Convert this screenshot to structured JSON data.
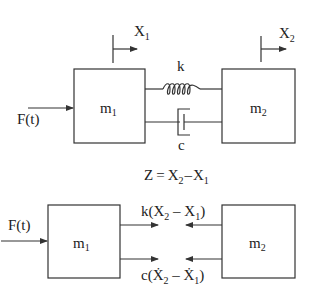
{
  "top_diagram": {
    "mass1": {
      "label": "m",
      "sub": "1"
    },
    "mass2": {
      "label": "m",
      "sub": "2"
    },
    "disp1": {
      "label": "X",
      "sub": "1"
    },
    "disp2": {
      "label": "X",
      "sub": "2"
    },
    "spring_label": "k",
    "damper_label": "c",
    "force_label": "F(t)"
  },
  "relation": {
    "lhs": "Z",
    "eq": "=",
    "term1": "X",
    "term1_sub": "2",
    "minus": "–",
    "term2": "X",
    "term2_sub": "1"
  },
  "free_body": {
    "mass1": {
      "label": "m",
      "sub": "1"
    },
    "mass2": {
      "label": "m",
      "sub": "2"
    },
    "force_label": "F(t)",
    "spring_force": {
      "pre": "k(X",
      "s1": "2",
      "mid": " – X",
      "s2": "1",
      "post": ")"
    },
    "damper_force": {
      "pre": "c(Ẋ",
      "s1": "2",
      "mid": " – Ẋ",
      "s2": "1",
      "post": ")"
    }
  },
  "colors": {
    "stroke": "#333333",
    "background": "#ffffff"
  }
}
